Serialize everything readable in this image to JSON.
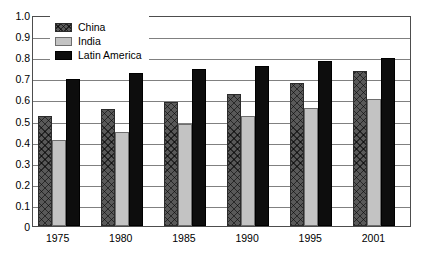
{
  "chart_data": {
    "type": "bar",
    "title": "",
    "subtitle": "",
    "xlabel": "",
    "ylabel": "",
    "categories": [
      "1975",
      "1980",
      "1985",
      "1990",
      "1995",
      "2001"
    ],
    "series": [
      {
        "name": "China",
        "values": [
          0.52,
          0.555,
          0.59,
          0.625,
          0.68,
          0.735
        ],
        "color": "#595959",
        "pattern": "crosshatch"
      },
      {
        "name": "India",
        "values": [
          0.41,
          0.445,
          0.485,
          0.52,
          0.56,
          0.6
        ],
        "color": "#c3c3c3",
        "pattern": "solid"
      },
      {
        "name": "Latin America",
        "values": [
          0.695,
          0.725,
          0.745,
          0.76,
          0.78,
          0.795
        ],
        "color": "#0d0d0d",
        "pattern": "solid"
      }
    ],
    "ylim": [
      0,
      1.0
    ],
    "ytick_labels": [
      "0",
      "0.1",
      "0.2",
      "0.3",
      "0.4",
      "0.5",
      "0.6",
      "0.7",
      "0.8",
      "0.9",
      "1.0"
    ],
    "ytick_values": [
      0,
      0.1,
      0.2,
      0.3,
      0.4,
      0.5,
      0.6,
      0.7,
      0.8,
      0.9,
      1.0
    ],
    "grid": true,
    "grid_axis": "y",
    "legend_position": "top-left-inside",
    "legend_entries": [
      "China",
      "India",
      "Latin America"
    ],
    "annotations": []
  },
  "legend": {
    "items": [
      {
        "label": "China"
      },
      {
        "label": "India"
      },
      {
        "label": "Latin America"
      }
    ]
  }
}
